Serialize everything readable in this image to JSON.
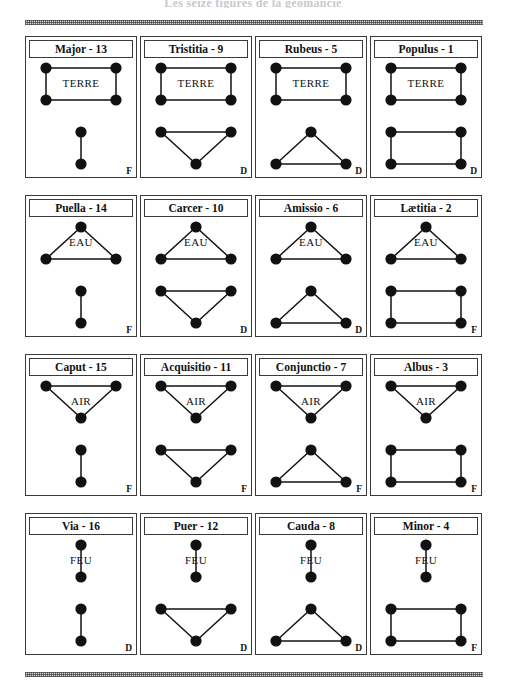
{
  "page": {
    "heading": "Les seize figures de la géomancie",
    "rule_style": "halftone-dither",
    "ink_color": "#111111",
    "border_color": "#3a3a3a",
    "dot_color": "#111111"
  },
  "legend": {
    "fixed_letter": "F",
    "mobile_letter": "D"
  },
  "cards": [
    {
      "name": "Major - 13",
      "figure_name": "Major",
      "number": "13",
      "element": "TERRE",
      "corner": "F",
      "rows": [
        2,
        2,
        1,
        1
      ]
    },
    {
      "name": "Tristitia - 9",
      "figure_name": "Tristitia",
      "number": "9",
      "element": "TERRE",
      "corner": "D",
      "rows": [
        2,
        2,
        2,
        1
      ]
    },
    {
      "name": "Rubeus - 5",
      "figure_name": "Rubeus",
      "number": "5",
      "element": "TERRE",
      "corner": "D",
      "rows": [
        2,
        2,
        1,
        2
      ]
    },
    {
      "name": "Populus - 1",
      "figure_name": "Populus",
      "number": "1",
      "element": "TERRE",
      "corner": "D",
      "rows": [
        2,
        2,
        2,
        2
      ]
    },
    {
      "name": "Puella - 14",
      "figure_name": "Puella",
      "number": "14",
      "element": "EAU",
      "corner": "F",
      "rows": [
        1,
        2,
        1,
        1
      ]
    },
    {
      "name": "Carcer - 10",
      "figure_name": "Carcer",
      "number": "10",
      "element": "EAU",
      "corner": "D",
      "rows": [
        1,
        2,
        2,
        1
      ]
    },
    {
      "name": "Amissio - 6",
      "figure_name": "Amissio",
      "number": "6",
      "element": "EAU",
      "corner": "D",
      "rows": [
        1,
        2,
        1,
        2
      ]
    },
    {
      "name": "Lætitia - 2",
      "figure_name": "Lætitia",
      "number": "2",
      "element": "EAU",
      "corner": "F",
      "rows": [
        1,
        2,
        2,
        2
      ]
    },
    {
      "name": "Caput - 15",
      "figure_name": "Caput",
      "number": "15",
      "element": "AIR",
      "corner": "F",
      "rows": [
        2,
        1,
        1,
        1
      ]
    },
    {
      "name": "Acquisitio - 11",
      "figure_name": "Acquisitio",
      "number": "11",
      "element": "AIR",
      "corner": "F",
      "rows": [
        2,
        1,
        2,
        1
      ]
    },
    {
      "name": "Conjunctio - 7",
      "figure_name": "Conjunctio",
      "number": "7",
      "element": "AIR",
      "corner": "F",
      "rows": [
        2,
        1,
        1,
        2
      ]
    },
    {
      "name": "Albus - 3",
      "figure_name": "Albus",
      "number": "3",
      "element": "AIR",
      "corner": "F",
      "rows": [
        2,
        1,
        2,
        2
      ]
    },
    {
      "name": "Via - 16",
      "figure_name": "Via",
      "number": "16",
      "element": "FEU",
      "corner": "D",
      "rows": [
        1,
        1,
        1,
        1
      ]
    },
    {
      "name": "Puer - 12",
      "figure_name": "Puer",
      "number": "12",
      "element": "FEU",
      "corner": "D",
      "rows": [
        1,
        1,
        2,
        1
      ]
    },
    {
      "name": "Cauda - 8",
      "figure_name": "Cauda",
      "number": "8",
      "element": "FEU",
      "corner": "D",
      "rows": [
        1,
        1,
        1,
        2
      ]
    },
    {
      "name": "Minor - 4",
      "figure_name": "Minor",
      "number": "4",
      "element": "FEU",
      "corner": "F",
      "rows": [
        1,
        1,
        2,
        2
      ]
    }
  ]
}
